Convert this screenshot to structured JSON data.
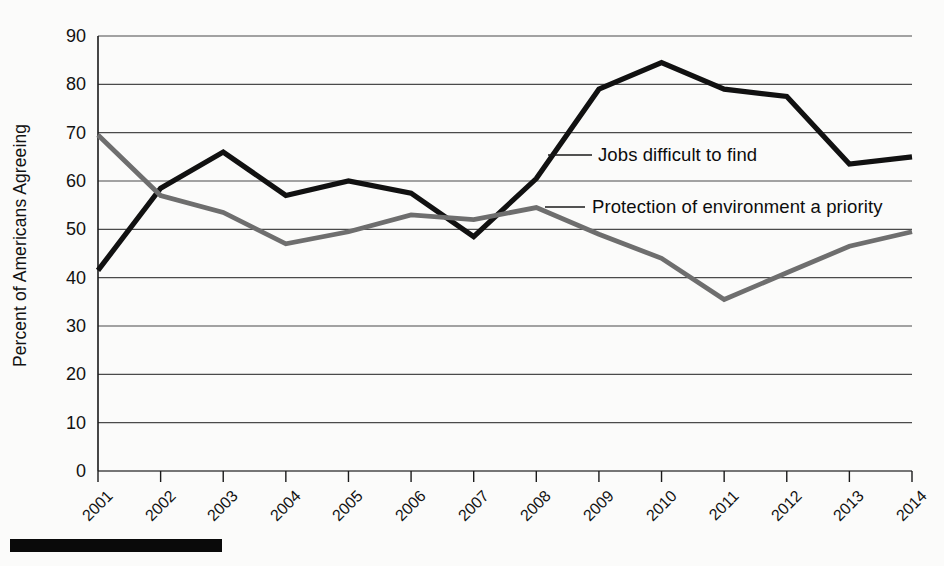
{
  "chart_data": {
    "type": "line",
    "title": "",
    "xlabel": "",
    "ylabel": "Percent of Americans Agreeing",
    "categories": [
      "2001",
      "2002",
      "2003",
      "2004",
      "2005",
      "2006",
      "2007",
      "2008",
      "2009",
      "2010",
      "2011",
      "2012",
      "2013",
      "2014"
    ],
    "x": [
      2001,
      2002,
      2003,
      2004,
      2005,
      2006,
      2007,
      2008,
      2009,
      2010,
      2011,
      2012,
      2013,
      2014
    ],
    "ylim": [
      0,
      90
    ],
    "yticks": [
      0,
      10,
      20,
      30,
      40,
      50,
      60,
      70,
      80,
      90
    ],
    "grid": true,
    "legend_position": "inline-annotation",
    "series": [
      {
        "name": "Jobs difficult to find",
        "color": "#111111",
        "values": [
          41.5,
          58.5,
          66,
          57,
          60,
          57.5,
          48.5,
          60.5,
          79,
          84.5,
          79,
          77.5,
          63.5,
          65
        ]
      },
      {
        "name": "Protection of environment a priority",
        "color": "#6e6e6e",
        "values": [
          69.5,
          57,
          53.5,
          47,
          49.5,
          53,
          52,
          54.5,
          49,
          44,
          35.5,
          41,
          46.5,
          49.5
        ]
      }
    ],
    "annotations": [
      {
        "text": "Jobs difficult to find",
        "series": "Jobs difficult to find"
      },
      {
        "text": "Protection of environment a priority",
        "series": "Protection of environment a priority"
      }
    ]
  },
  "axis": {
    "y_title": "Percent of Americans Agreeing",
    "y_tick_labels": [
      "90",
      "80",
      "70",
      "60",
      "50",
      "40",
      "30",
      "20",
      "10",
      "0"
    ],
    "x_tick_labels": [
      "2001",
      "2002",
      "2003",
      "2004",
      "2005",
      "2006",
      "2007",
      "2008",
      "2009",
      "2010",
      "2011",
      "2012",
      "2013",
      "2014"
    ]
  },
  "labels": {
    "jobs": "Jobs difficult to find",
    "environment": "Protection of environment a priority"
  },
  "colors": {
    "jobs_line": "#111111",
    "environment_line": "#6e6e6e",
    "grid": "#4a4a4a",
    "axis": "#1a1a1a",
    "text": "#121212",
    "background": "#fbfbfa",
    "rule": "#0a0a0a"
  }
}
